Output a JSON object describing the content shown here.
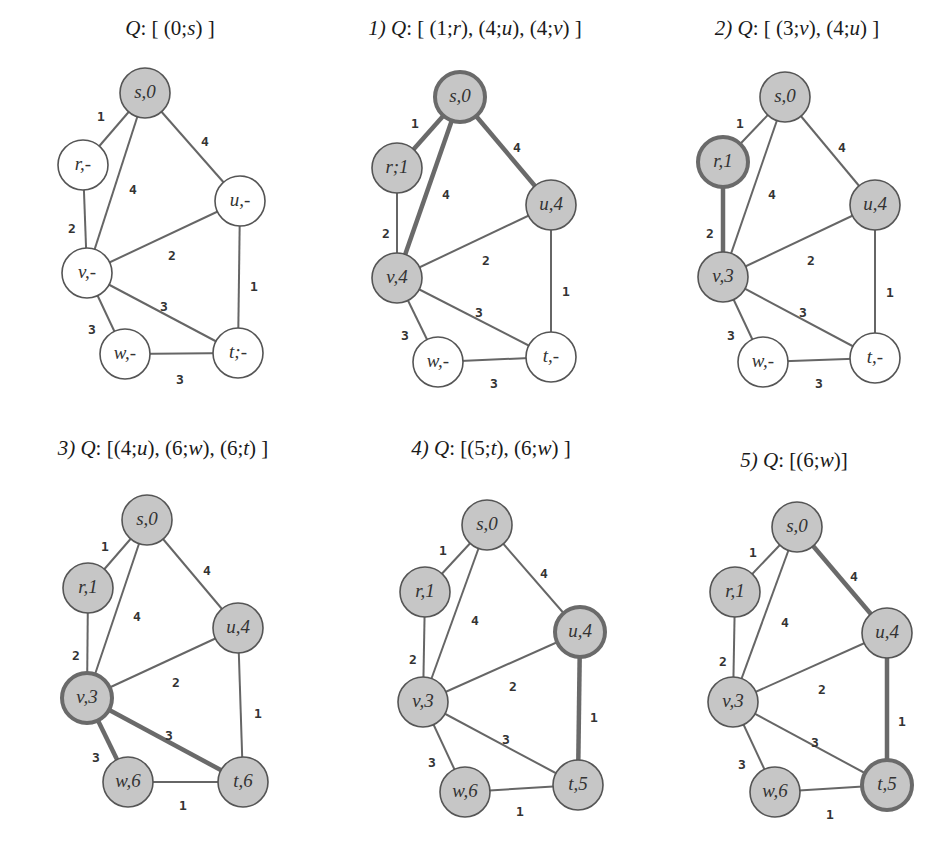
{
  "colors": {
    "background": "#ffffff",
    "node_unvisited_fill": "#ffffff",
    "node_reached_fill": "#c6c6c6",
    "node_stroke": "#555555",
    "highlight_stroke": "#6a6a6a",
    "edge": "#666666",
    "text": "#333333"
  },
  "panels": [
    {
      "id": "step-0",
      "step_label": "",
      "queue_label": "Q",
      "queue_contents": "[ (0;s) ]",
      "title_pos": [
        170,
        40
      ],
      "nodes": [
        {
          "id": "s",
          "label": "s,0",
          "x": 145,
          "y": 93,
          "filled": true,
          "highlight": false
        },
        {
          "id": "r",
          "label": "r,-",
          "x": 83,
          "y": 165,
          "filled": false,
          "highlight": false
        },
        {
          "id": "u",
          "label": "u,-",
          "x": 240,
          "y": 201,
          "filled": false,
          "highlight": false
        },
        {
          "id": "v",
          "label": "v,-",
          "x": 87,
          "y": 273,
          "filled": false,
          "highlight": false
        },
        {
          "id": "w",
          "label": "w,-",
          "x": 125,
          "y": 354,
          "filled": false,
          "highlight": false
        },
        {
          "id": "t",
          "label": "t;-",
          "x": 238,
          "y": 353,
          "filled": false,
          "highlight": false
        }
      ],
      "edges": [
        {
          "from": "s",
          "to": "r",
          "weight": "1",
          "highlight": false,
          "lx": 101,
          "ly": 117
        },
        {
          "from": "s",
          "to": "v",
          "weight": "4",
          "highlight": false,
          "lx": 133,
          "ly": 190
        },
        {
          "from": "s",
          "to": "u",
          "weight": "4",
          "highlight": false,
          "lx": 205,
          "ly": 142
        },
        {
          "from": "r",
          "to": "v",
          "weight": "2",
          "highlight": false,
          "lx": 72,
          "ly": 229
        },
        {
          "from": "v",
          "to": "u",
          "weight": "2",
          "highlight": false,
          "lx": 172,
          "ly": 256
        },
        {
          "from": "u",
          "to": "t",
          "weight": "1",
          "highlight": false,
          "lx": 254,
          "ly": 287
        },
        {
          "from": "v",
          "to": "t",
          "weight": "3",
          "highlight": false,
          "lx": 164,
          "ly": 307
        },
        {
          "from": "v",
          "to": "w",
          "weight": "3",
          "highlight": false,
          "lx": 92,
          "ly": 330
        },
        {
          "from": "w",
          "to": "t",
          "weight": "3",
          "highlight": false,
          "lx": 180,
          "ly": 380
        }
      ]
    },
    {
      "id": "step-1",
      "step_label": "1)",
      "queue_label": "Q",
      "queue_contents": "[ (1;r), (4;u), (4;v) ]",
      "title_pos": [
        475,
        40
      ],
      "nodes": [
        {
          "id": "s",
          "label": "s,0",
          "x": 460,
          "y": 97,
          "filled": true,
          "highlight": true
        },
        {
          "id": "r",
          "label": "r;1",
          "x": 397,
          "y": 168,
          "filled": true,
          "highlight": false
        },
        {
          "id": "u",
          "label": "u,4",
          "x": 551,
          "y": 205,
          "filled": true,
          "highlight": false
        },
        {
          "id": "v",
          "label": "v,4",
          "x": 397,
          "y": 278,
          "filled": true,
          "highlight": false
        },
        {
          "id": "w",
          "label": "w,-",
          "x": 438,
          "y": 362,
          "filled": false,
          "highlight": false
        },
        {
          "id": "t",
          "label": "t,-",
          "x": 551,
          "y": 357,
          "filled": false,
          "highlight": false
        }
      ],
      "edges": [
        {
          "from": "s",
          "to": "r",
          "weight": "1",
          "highlight": true,
          "lx": 415,
          "ly": 124
        },
        {
          "from": "s",
          "to": "v",
          "weight": "4",
          "highlight": true,
          "lx": 446,
          "ly": 195
        },
        {
          "from": "s",
          "to": "u",
          "weight": "4",
          "highlight": true,
          "lx": 517,
          "ly": 148
        },
        {
          "from": "r",
          "to": "v",
          "weight": "2",
          "highlight": false,
          "lx": 386,
          "ly": 234
        },
        {
          "from": "v",
          "to": "u",
          "weight": "2",
          "highlight": false,
          "lx": 486,
          "ly": 261
        },
        {
          "from": "u",
          "to": "t",
          "weight": "1",
          "highlight": false,
          "lx": 566,
          "ly": 292
        },
        {
          "from": "v",
          "to": "t",
          "weight": "3",
          "highlight": false,
          "lx": 479,
          "ly": 313
        },
        {
          "from": "v",
          "to": "w",
          "weight": "3",
          "highlight": false,
          "lx": 405,
          "ly": 336
        },
        {
          "from": "w",
          "to": "t",
          "weight": "3",
          "highlight": false,
          "lx": 494,
          "ly": 384
        }
      ]
    },
    {
      "id": "step-2",
      "step_label": "2)",
      "queue_label": "Q",
      "queue_contents": "[ (3;v), (4;u) ]",
      "title_pos": [
        797,
        40
      ],
      "nodes": [
        {
          "id": "s",
          "label": "s,0",
          "x": 785,
          "y": 97,
          "filled": true,
          "highlight": false
        },
        {
          "id": "r",
          "label": "r,1",
          "x": 723,
          "y": 162,
          "filled": true,
          "highlight": true
        },
        {
          "id": "u",
          "label": "u,4",
          "x": 875,
          "y": 205,
          "filled": true,
          "highlight": false
        },
        {
          "id": "v",
          "label": "v,3",
          "x": 723,
          "y": 277,
          "filled": true,
          "highlight": false
        },
        {
          "id": "w",
          "label": "w,-",
          "x": 763,
          "y": 362,
          "filled": false,
          "highlight": false
        },
        {
          "id": "t",
          "label": "t,-",
          "x": 875,
          "y": 358,
          "filled": false,
          "highlight": false
        }
      ],
      "edges": [
        {
          "from": "s",
          "to": "r",
          "weight": "1",
          "highlight": false,
          "lx": 740,
          "ly": 124
        },
        {
          "from": "s",
          "to": "v",
          "weight": "4",
          "highlight": false,
          "lx": 772,
          "ly": 195
        },
        {
          "from": "s",
          "to": "u",
          "weight": "4",
          "highlight": false,
          "lx": 842,
          "ly": 148
        },
        {
          "from": "r",
          "to": "v",
          "weight": "2",
          "highlight": true,
          "lx": 710,
          "ly": 234
        },
        {
          "from": "v",
          "to": "u",
          "weight": "2",
          "highlight": false,
          "lx": 811,
          "ly": 261
        },
        {
          "from": "u",
          "to": "t",
          "weight": "1",
          "highlight": false,
          "lx": 890,
          "ly": 293
        },
        {
          "from": "v",
          "to": "t",
          "weight": "3",
          "highlight": false,
          "lx": 803,
          "ly": 313
        },
        {
          "from": "v",
          "to": "w",
          "weight": "3",
          "highlight": false,
          "lx": 731,
          "ly": 336
        },
        {
          "from": "w",
          "to": "t",
          "weight": "3",
          "highlight": false,
          "lx": 819,
          "ly": 384
        }
      ]
    },
    {
      "id": "step-3",
      "step_label": "3)",
      "queue_label": "Q",
      "queue_contents": "[(4;u), (6;w), (6;t) ]",
      "title_pos": [
        163,
        460
      ],
      "nodes": [
        {
          "id": "s",
          "label": "s,0",
          "x": 147,
          "y": 520,
          "filled": true,
          "highlight": false
        },
        {
          "id": "r",
          "label": "r,1",
          "x": 88,
          "y": 588,
          "filled": true,
          "highlight": false
        },
        {
          "id": "u",
          "label": "u,4",
          "x": 238,
          "y": 628,
          "filled": true,
          "highlight": false
        },
        {
          "id": "v",
          "label": "v,3",
          "x": 87,
          "y": 698,
          "filled": true,
          "highlight": true
        },
        {
          "id": "w",
          "label": "w,6",
          "x": 128,
          "y": 782,
          "filled": true,
          "highlight": false
        },
        {
          "id": "t",
          "label": "t,6",
          "x": 243,
          "y": 782,
          "filled": true,
          "highlight": false
        }
      ],
      "edges": [
        {
          "from": "s",
          "to": "r",
          "weight": "1",
          "highlight": false,
          "lx": 105,
          "ly": 547
        },
        {
          "from": "s",
          "to": "v",
          "weight": "4",
          "highlight": false,
          "lx": 137,
          "ly": 617
        },
        {
          "from": "s",
          "to": "u",
          "weight": "4",
          "highlight": false,
          "lx": 207,
          "ly": 571
        },
        {
          "from": "r",
          "to": "v",
          "weight": "2",
          "highlight": false,
          "lx": 76,
          "ly": 656
        },
        {
          "from": "v",
          "to": "u",
          "weight": "2",
          "highlight": false,
          "lx": 176,
          "ly": 683
        },
        {
          "from": "u",
          "to": "t",
          "weight": "1",
          "highlight": false,
          "lx": 258,
          "ly": 714
        },
        {
          "from": "v",
          "to": "t",
          "weight": "3",
          "highlight": true,
          "lx": 169,
          "ly": 736
        },
        {
          "from": "v",
          "to": "w",
          "weight": "3",
          "highlight": true,
          "lx": 96,
          "ly": 758
        },
        {
          "from": "w",
          "to": "t",
          "weight": "1",
          "highlight": false,
          "lx": 183,
          "ly": 806
        }
      ]
    },
    {
      "id": "step-4",
      "step_label": "4)",
      "queue_label": "Q",
      "queue_contents": "[(5;t), (6;w) ]",
      "title_pos": [
        491,
        460
      ],
      "nodes": [
        {
          "id": "s",
          "label": "s,0",
          "x": 487,
          "y": 525,
          "filled": true,
          "highlight": false
        },
        {
          "id": "r",
          "label": "r,1",
          "x": 425,
          "y": 592,
          "filled": true,
          "highlight": false
        },
        {
          "id": "u",
          "label": "u,4",
          "x": 580,
          "y": 632,
          "filled": true,
          "highlight": true
        },
        {
          "id": "v",
          "label": "v,3",
          "x": 423,
          "y": 702,
          "filled": true,
          "highlight": false
        },
        {
          "id": "w",
          "label": "w,6",
          "x": 465,
          "y": 792,
          "filled": true,
          "highlight": false
        },
        {
          "id": "t",
          "label": "t,5",
          "x": 578,
          "y": 785,
          "filled": true,
          "highlight": false
        }
      ],
      "edges": [
        {
          "from": "s",
          "to": "r",
          "weight": "1",
          "highlight": false,
          "lx": 443,
          "ly": 551
        },
        {
          "from": "s",
          "to": "v",
          "weight": "4",
          "highlight": false,
          "lx": 475,
          "ly": 621
        },
        {
          "from": "s",
          "to": "u",
          "weight": "4",
          "highlight": false,
          "lx": 544,
          "ly": 574
        },
        {
          "from": "r",
          "to": "v",
          "weight": "2",
          "highlight": false,
          "lx": 413,
          "ly": 660
        },
        {
          "from": "v",
          "to": "u",
          "weight": "2",
          "highlight": false,
          "lx": 513,
          "ly": 687
        },
        {
          "from": "u",
          "to": "t",
          "weight": "1",
          "highlight": true,
          "lx": 594,
          "ly": 718
        },
        {
          "from": "v",
          "to": "t",
          "weight": "3",
          "highlight": false,
          "lx": 506,
          "ly": 740
        },
        {
          "from": "v",
          "to": "w",
          "weight": "3",
          "highlight": false,
          "lx": 432,
          "ly": 763
        },
        {
          "from": "w",
          "to": "t",
          "weight": "1",
          "highlight": false,
          "lx": 520,
          "ly": 812
        }
      ]
    },
    {
      "id": "step-5",
      "step_label": "5)",
      "queue_label": "Q",
      "queue_contents": "[(6;w)]",
      "title_pos": [
        794,
        472
      ],
      "nodes": [
        {
          "id": "s",
          "label": "s,0",
          "x": 797,
          "y": 527,
          "filled": true,
          "highlight": false
        },
        {
          "id": "r",
          "label": "r,1",
          "x": 735,
          "y": 592,
          "filled": true,
          "highlight": false
        },
        {
          "id": "u",
          "label": "u,4",
          "x": 887,
          "y": 633,
          "filled": true,
          "highlight": false
        },
        {
          "id": "v",
          "label": "v,3",
          "x": 733,
          "y": 702,
          "filled": true,
          "highlight": false
        },
        {
          "id": "w",
          "label": "w,6",
          "x": 775,
          "y": 792,
          "filled": true,
          "highlight": false
        },
        {
          "id": "t",
          "label": "t,5",
          "x": 887,
          "y": 785,
          "filled": true,
          "highlight": true
        }
      ],
      "edges": [
        {
          "from": "s",
          "to": "r",
          "weight": "1",
          "highlight": false,
          "lx": 753,
          "ly": 553
        },
        {
          "from": "s",
          "to": "v",
          "weight": "4",
          "highlight": false,
          "lx": 785,
          "ly": 623
        },
        {
          "from": "s",
          "to": "u",
          "weight": "4",
          "highlight": true,
          "lx": 854,
          "ly": 577
        },
        {
          "from": "r",
          "to": "v",
          "weight": "2",
          "highlight": false,
          "lx": 723,
          "ly": 662
        },
        {
          "from": "v",
          "to": "u",
          "weight": "2",
          "highlight": false,
          "lx": 822,
          "ly": 690
        },
        {
          "from": "u",
          "to": "t",
          "weight": "1",
          "highlight": true,
          "lx": 902,
          "ly": 722
        },
        {
          "from": "v",
          "to": "t",
          "weight": "3",
          "highlight": false,
          "lx": 815,
          "ly": 743
        },
        {
          "from": "v",
          "to": "w",
          "weight": "3",
          "highlight": false,
          "lx": 742,
          "ly": 765
        },
        {
          "from": "w",
          "to": "t",
          "weight": "1",
          "highlight": false,
          "lx": 830,
          "ly": 815
        }
      ]
    }
  ]
}
